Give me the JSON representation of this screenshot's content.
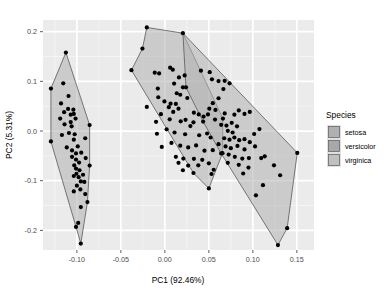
{
  "chart_data": {
    "type": "scatter",
    "title": "",
    "xlabel": "PC1 (92.46%)",
    "ylabel": "PC2 (5.31%)",
    "xlim": [
      -0.1385,
      0.1695
    ],
    "ylim": [
      -0.2395,
      0.2235
    ],
    "xticks": [
      -0.1,
      -0.05,
      0.0,
      0.05,
      0.1,
      0.15
    ],
    "xtick_labels": [
      "-0.10",
      "-0.05",
      "0.00",
      "0.05",
      "0.10",
      "0.15"
    ],
    "yticks": [
      0.2,
      0.1,
      0.0,
      -0.1,
      -0.2
    ],
    "ytick_labels": [
      "0.2",
      "0.1",
      "0.0",
      "-0.1",
      "-0.2"
    ],
    "grid": true,
    "grid_major_color": "#ffffff",
    "grid_minor_color": "#f5f5f5",
    "panel_background": "#ebebeb",
    "point_color": "#000000",
    "point_size": 2.1,
    "hull_stroke": "#595959",
    "legend_position": "right",
    "legend_title": "Species",
    "series": [
      {
        "name": "setosa",
        "fill": "#b0b0b0",
        "fill_opacity": 0.55,
        "hull": [
          [
            -0.1295,
            0.0855
          ],
          [
            -0.1125,
            0.158
          ],
          [
            -0.0855,
            0.012
          ],
          [
            -0.0855,
            -0.0695
          ],
          [
            -0.088,
            -0.143
          ],
          [
            -0.0955,
            -0.2265
          ],
          [
            -0.101,
            -0.193
          ],
          [
            -0.1295,
            -0.021
          ]
        ],
        "points": [
          [
            -0.1295,
            0.0855
          ],
          [
            -0.1125,
            0.158
          ],
          [
            -0.1155,
            0.096
          ],
          [
            -0.118,
            0.0555
          ],
          [
            -0.1095,
            0.0705
          ],
          [
            -0.107,
            0.033
          ],
          [
            -0.1145,
            0.038
          ],
          [
            -0.119,
            0.025
          ],
          [
            -0.11,
            0.0445
          ],
          [
            -0.104,
            0.043
          ],
          [
            -0.1035,
            0.0345
          ],
          [
            -0.1015,
            0.025
          ],
          [
            -0.114,
            0.0135
          ],
          [
            -0.106,
            0.0095
          ],
          [
            -0.1295,
            -0.021
          ],
          [
            -0.117,
            -0.008
          ],
          [
            -0.109,
            -0.004
          ],
          [
            -0.1025,
            -0.0065
          ],
          [
            -0.1035,
            -0.0175
          ],
          [
            -0.1115,
            -0.033
          ],
          [
            -0.1055,
            -0.039
          ],
          [
            -0.099,
            -0.031
          ],
          [
            -0.101,
            -0.045
          ],
          [
            -0.095,
            -0.0435
          ],
          [
            -0.1055,
            -0.052
          ],
          [
            -0.101,
            -0.0575
          ],
          [
            -0.0975,
            -0.0635
          ],
          [
            -0.103,
            -0.069
          ],
          [
            -0.101,
            -0.0755
          ],
          [
            -0.097,
            -0.079
          ],
          [
            -0.1005,
            -0.086
          ],
          [
            -0.098,
            -0.093
          ],
          [
            -0.1035,
            -0.0905
          ],
          [
            -0.0955,
            -0.1015
          ],
          [
            -0.1,
            -0.11
          ],
          [
            -0.096,
            -0.1175
          ],
          [
            -0.1035,
            -0.1215
          ],
          [
            -0.0905,
            -0.127
          ],
          [
            -0.088,
            -0.143
          ],
          [
            -0.0955,
            -0.153
          ],
          [
            -0.0985,
            -0.185
          ],
          [
            -0.101,
            -0.193
          ],
          [
            -0.0955,
            -0.2265
          ],
          [
            -0.0855,
            0.012
          ],
          [
            -0.0905,
            -0.0145
          ],
          [
            -0.09,
            -0.0545
          ],
          [
            -0.0855,
            -0.0695
          ],
          [
            -0.093,
            -0.088
          ],
          [
            -0.0915,
            -0.1025
          ],
          [
            -0.107,
            0.018
          ]
        ]
      },
      {
        "name": "versicolor",
        "fill": "#b0b0b0",
        "fill_opacity": 0.55,
        "hull": [
          [
            -0.0205,
            0.2085
          ],
          [
            0.0205,
            0.197
          ],
          [
            0.066,
            0.025
          ],
          [
            0.0655,
            -0.0445
          ],
          [
            0.05,
            -0.1155
          ],
          [
            0.0325,
            -0.0845
          ],
          [
            -0.038,
            0.1225
          ],
          [
            -0.0255,
            0.166
          ]
        ],
        "points": [
          [
            -0.0205,
            0.2085
          ],
          [
            -0.0255,
            0.166
          ],
          [
            -0.038,
            0.1225
          ],
          [
            -0.0115,
            0.1175
          ],
          [
            -0.0065,
            0.116
          ],
          [
            0.006,
            0.1275
          ],
          [
            0.009,
            0.1235
          ],
          [
            0.0225,
            0.112
          ],
          [
            0.016,
            0.108
          ],
          [
            -0.008,
            0.0855
          ],
          [
            0.0105,
            0.0955
          ],
          [
            0.0205,
            0.088
          ],
          [
            0.0135,
            0.076
          ],
          [
            -0.0075,
            0.068
          ],
          [
            -0.0205,
            0.0485
          ],
          [
            -0.0005,
            0.0595
          ],
          [
            0.0065,
            0.055
          ],
          [
            0.0125,
            0.0545
          ],
          [
            0.0045,
            0.048
          ],
          [
            0.0155,
            0.045
          ],
          [
            0.0095,
            0.0385
          ],
          [
            0.0255,
            0.0665
          ],
          [
            0.033,
            0.037
          ],
          [
            0.0385,
            0.0335
          ],
          [
            0.044,
            0.029
          ],
          [
            0.049,
            0.0335
          ],
          [
            0.066,
            0.025
          ],
          [
            -0.0045,
            0.034
          ],
          [
            -0.01,
            0.0185
          ],
          [
            0.0055,
            0.0235
          ],
          [
            0.018,
            0.0195
          ],
          [
            0.0235,
            0.0225
          ],
          [
            0.0325,
            0.0175
          ],
          [
            -0.009,
            -0.0055
          ],
          [
            0.002,
            0.0035
          ],
          [
            0.011,
            -0.003
          ],
          [
            0.023,
            -0.0065
          ],
          [
            0.039,
            -0.0085
          ],
          [
            0.048,
            -0.005
          ],
          [
            0.052,
            -0.013
          ],
          [
            -0.0035,
            -0.032
          ],
          [
            0.0075,
            -0.024
          ],
          [
            0.0175,
            -0.0295
          ],
          [
            0.0265,
            -0.033
          ],
          [
            0.0355,
            -0.029
          ],
          [
            0.045,
            -0.0395
          ],
          [
            0.0545,
            -0.0385
          ],
          [
            0.0655,
            -0.0445
          ],
          [
            0.0125,
            -0.052
          ],
          [
            0.021,
            -0.0555
          ],
          [
            0.033,
            -0.056
          ],
          [
            0.0425,
            -0.058
          ],
          [
            0.0155,
            -0.064
          ],
          [
            0.0265,
            -0.0695
          ],
          [
            0.038,
            -0.069
          ],
          [
            0.05,
            -0.065
          ],
          [
            0.0205,
            -0.079
          ],
          [
            0.0325,
            -0.0845
          ],
          [
            0.0555,
            -0.078
          ],
          [
            0.05,
            -0.1155
          ],
          [
            0.053,
            -0.0865
          ],
          [
            0.029,
            0.01
          ],
          [
            0.0175,
            0.073
          ]
        ]
      },
      {
        "name": "virginica",
        "fill": "#b0b0b0",
        "fill_opacity": 0.55,
        "hull": [
          [
            0.0205,
            0.197
          ],
          [
            0.1505,
            -0.044
          ],
          [
            0.139,
            -0.1955
          ],
          [
            0.1285,
            -0.2295
          ],
          [
            0.064,
            -0.045
          ],
          [
            0.0435,
            0.019
          ],
          [
            0.024,
            0.088
          ]
        ],
        "points": [
          [
            0.0205,
            0.197
          ],
          [
            0.041,
            0.1215
          ],
          [
            0.051,
            0.1185
          ],
          [
            0.0535,
            0.104
          ],
          [
            0.061,
            0.1005
          ],
          [
            0.068,
            0.101
          ],
          [
            0.0735,
            0.096
          ],
          [
            0.0665,
            0.0845
          ],
          [
            0.061,
            0.066
          ],
          [
            0.0545,
            0.056
          ],
          [
            0.0505,
            0.045
          ],
          [
            0.0575,
            0.0425
          ],
          [
            0.068,
            0.0355
          ],
          [
            0.079,
            0.033
          ],
          [
            0.084,
            0.0415
          ],
          [
            0.0905,
            0.0345
          ],
          [
            0.0965,
            0.0385
          ],
          [
            0.024,
            0.088
          ],
          [
            0.0435,
            0.019
          ],
          [
            0.057,
            0.023
          ],
          [
            0.064,
            0.0125
          ],
          [
            0.07,
            0.011
          ],
          [
            0.076,
            0.0165
          ],
          [
            0.082,
            0.0095
          ],
          [
            0.0715,
            0.0005
          ],
          [
            0.077,
            -0.003
          ],
          [
            0.1075,
            0.004
          ],
          [
            0.0675,
            -0.0145
          ],
          [
            0.0735,
            -0.0175
          ],
          [
            0.079,
            -0.013
          ],
          [
            0.0845,
            -0.0185
          ],
          [
            0.0905,
            -0.0165
          ],
          [
            0.0965,
            -0.0225
          ],
          [
            0.069,
            -0.031
          ],
          [
            0.075,
            -0.0345
          ],
          [
            0.0825,
            -0.03
          ],
          [
            0.0905,
            -0.037
          ],
          [
            0.1025,
            -0.031
          ],
          [
            0.064,
            -0.045
          ],
          [
            0.0725,
            -0.0475
          ],
          [
            0.0795,
            -0.052
          ],
          [
            0.088,
            -0.0555
          ],
          [
            0.0955,
            -0.0545
          ],
          [
            0.1095,
            -0.0545
          ],
          [
            0.1135,
            -0.051
          ],
          [
            0.0715,
            -0.064
          ],
          [
            0.084,
            -0.068
          ],
          [
            0.095,
            -0.0735
          ],
          [
            0.124,
            -0.069
          ],
          [
            0.089,
            -0.0855
          ],
          [
            0.131,
            -0.089
          ],
          [
            0.1115,
            -0.109
          ],
          [
            0.1035,
            -0.1295
          ],
          [
            0.1505,
            -0.044
          ],
          [
            0.139,
            -0.1955
          ],
          [
            0.1285,
            -0.2295
          ],
          [
            0.061,
            -0.0265
          ],
          [
            0.1015,
            -0.006
          ]
        ]
      }
    ]
  },
  "legend": {
    "title": "Species",
    "items": [
      {
        "label": "setosa",
        "swatch": "#b0b0b0"
      },
      {
        "label": "versicolor",
        "swatch": "#a8a8a8"
      },
      {
        "label": "virginica",
        "swatch": "#c0c0c0"
      }
    ]
  }
}
